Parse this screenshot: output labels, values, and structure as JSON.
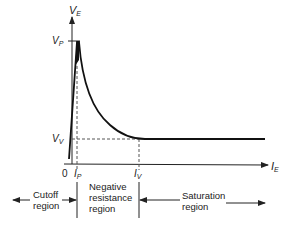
{
  "diagram": {
    "axes": {
      "y_label": "V",
      "y_sub": "E",
      "x_label": "I",
      "x_sub": "E",
      "origin": "0"
    },
    "points": {
      "peak_v": "V",
      "peak_v_sub": "P",
      "valley_v": "V",
      "valley_v_sub": "V",
      "peak_i": "I",
      "peak_i_sub": "P",
      "valley_i": "I",
      "valley_i_sub": "V"
    },
    "regions": {
      "cutoff": [
        "Cutoff",
        "region"
      ],
      "negative": [
        "Negative",
        "resistance",
        "region"
      ],
      "saturation": [
        "Saturation",
        "region"
      ]
    },
    "colors": {
      "ink": "#222222",
      "dash": "#555555",
      "background": "#ffffff"
    }
  }
}
